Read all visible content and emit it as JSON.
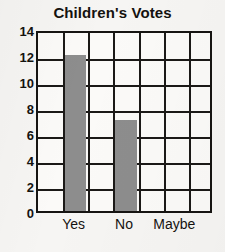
{
  "chart_data": {
    "type": "bar",
    "title": "Children's Votes",
    "xlabel": "",
    "ylabel": "",
    "categories": [
      "Yes",
      "No",
      "Maybe"
    ],
    "values": [
      12,
      7,
      0
    ],
    "ylim": [
      0,
      14
    ],
    "ytick_labels": [
      "0",
      "2",
      "4",
      "6",
      "8",
      "10",
      "12",
      "14"
    ],
    "ytick_values": [
      0,
      2,
      4,
      6,
      8,
      10,
      12,
      14
    ],
    "grid": true,
    "grid_columns": 7,
    "grid_rows": 7,
    "legend": "none",
    "bar_color": "#8d8d8d",
    "axis_color": "#1b1917",
    "background_color": "#f6f5f3",
    "bar_slots": [
      2,
      4,
      6
    ],
    "annotations": []
  }
}
